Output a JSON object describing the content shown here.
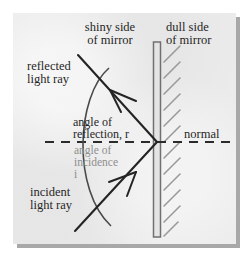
{
  "diagram": {
    "panel": {
      "background_color": "#ebebeb",
      "shadow_color": "#a8a8a8",
      "page_color": "#ffffff"
    },
    "labels": {
      "shiny_side": "shiny side\nof mirror",
      "dull_side": "dull side\nof mirror",
      "reflected_ray": "reflected\nlight ray",
      "incident_ray": "incident\nlight ray",
      "normal": "normal",
      "angle_of_reflection": "angle of\nreflection, r",
      "angle_of_incidence": "angle of\nincidence\ni"
    },
    "colors": {
      "ink": "#262626",
      "gray_ink": "#8e8e8e",
      "mirror_outline": "#707070",
      "mirror_fill": "#e4e4e4",
      "hatching": "#9a9a9a"
    },
    "geometry": {
      "mirror": {
        "x": 157,
        "top_y": 42,
        "bottom_y": 237,
        "thickness": 7
      },
      "incidence_point": {
        "x": 157,
        "y": 142
      },
      "normal_line": {
        "from_x": 45,
        "to_x": 236,
        "y": 142,
        "style": "dashed"
      },
      "reflected_ray": {
        "from_x": 78,
        "from_y": 55,
        "to_x": 157,
        "to_y": 142,
        "arrow_at": "upper-left"
      },
      "incident_ray": {
        "from_x": 75,
        "from_y": 231,
        "to_x": 157,
        "to_y": 142,
        "arrow_at": "upper-right"
      },
      "arc": {
        "center_x": 157,
        "center_y": 142,
        "radius": 92,
        "spans": "reflected ray to incident ray"
      }
    }
  }
}
